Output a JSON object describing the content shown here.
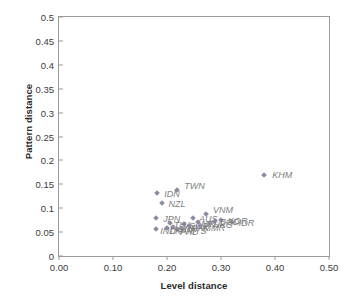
{
  "chart_data": {
    "type": "scatter",
    "title": "",
    "xlabel": "Level distance",
    "ylabel": "Pattern distance",
    "xlim": [
      0.0,
      0.5
    ],
    "ylim": [
      0.0,
      0.5
    ],
    "grid": false,
    "legend": "none",
    "xticks": [
      "0.00",
      "0.10",
      "0.20",
      "0.30",
      "0.40",
      "0.50"
    ],
    "xtick_values": [
      0.0,
      0.1,
      0.2,
      0.3,
      0.4,
      0.5
    ],
    "yticks": [
      "0",
      "0.05",
      "0.1",
      "0.15",
      "0.2",
      "0.25",
      "0.3",
      "0.35",
      "0.4",
      "0.45",
      "0.5"
    ],
    "ytick_values": [
      0.0,
      0.05,
      0.1,
      0.15,
      0.2,
      0.25,
      0.3,
      0.35,
      0.4,
      0.45,
      0.5
    ],
    "marker_color": "#8f8a9e",
    "label_color": "#7d7d7d",
    "points": [
      {
        "label": "KHM",
        "x": 0.38,
        "y": 0.17,
        "lx": 8,
        "ly": 0
      },
      {
        "label": "IDN",
        "x": 0.182,
        "y": 0.131,
        "lx": 7,
        "ly": 1
      },
      {
        "label": "TWN",
        "x": 0.219,
        "y": 0.138,
        "lx": 7,
        "ly": -4
      },
      {
        "label": "NZL",
        "x": 0.19,
        "y": 0.111,
        "lx": 7,
        "ly": 1
      },
      {
        "label": "JPN",
        "x": 0.18,
        "y": 0.079,
        "lx": 7,
        "ly": 1
      },
      {
        "label": "VNM",
        "x": 0.272,
        "y": 0.088,
        "lx": 7,
        "ly": -4
      },
      {
        "label": "AUS",
        "x": 0.248,
        "y": 0.079,
        "lx": 6,
        "ly": 1
      },
      {
        "label": "KOR",
        "x": 0.3,
        "y": 0.075,
        "lx": 7,
        "ly": 1
      },
      {
        "label": "IDR",
        "x": 0.32,
        "y": 0.072,
        "lx": 7,
        "ly": 1
      },
      {
        "label": "BGD",
        "x": 0.289,
        "y": 0.073,
        "lx": 5,
        "ly": 1
      },
      {
        "label": "SGP",
        "x": 0.232,
        "y": 0.066,
        "lx": 5,
        "ly": 2
      },
      {
        "label": "THA",
        "x": 0.205,
        "y": 0.068,
        "lx": 4,
        "ly": 2
      },
      {
        "label": "CHN",
        "x": 0.212,
        "y": 0.06,
        "lx": 4,
        "ly": 2
      },
      {
        "label": "MYS",
        "x": 0.228,
        "y": 0.057,
        "lx": 5,
        "ly": 2
      },
      {
        "label": "PHL",
        "x": 0.218,
        "y": 0.056,
        "lx": 3,
        "ly": 3
      },
      {
        "label": "LKA",
        "x": 0.2,
        "y": 0.058,
        "lx": 3,
        "ly": 3
      },
      {
        "label": "IND",
        "x": 0.18,
        "y": 0.057,
        "lx": 4,
        "ly": 2
      },
      {
        "label": "PAK",
        "x": 0.24,
        "y": 0.062,
        "lx": 3,
        "ly": 2
      },
      {
        "label": "NPL",
        "x": 0.258,
        "y": 0.072,
        "lx": 3,
        "ly": 2
      },
      {
        "label": "MMR",
        "x": 0.262,
        "y": 0.063,
        "lx": 3,
        "ly": 2
      },
      {
        "label": "HKG",
        "x": 0.28,
        "y": 0.07,
        "lx": 3,
        "ly": 2
      }
    ]
  }
}
